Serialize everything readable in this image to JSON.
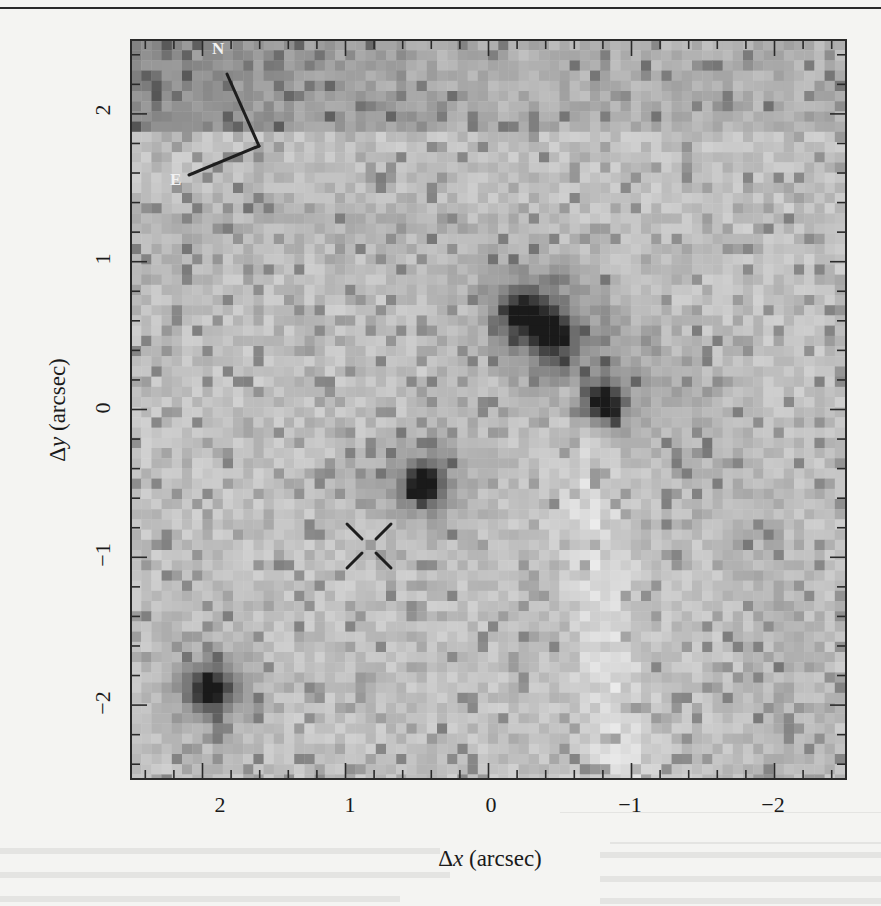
{
  "figure": {
    "type": "astronomical-image",
    "colormap": "grayscale-inverted",
    "frame_color": "#2a2a2a",
    "background_color": "#f4f4f2"
  },
  "chart_data": {
    "type": "heatmap",
    "title": "",
    "xlabel": "Δx (arcsec)",
    "xlabel_symbol": "Δ",
    "xlabel_var": "x",
    "xlabel_unit": " (arcsec)",
    "ylabel": "Δy (arcsec)",
    "ylabel_symbol": "Δ",
    "ylabel_var": "y",
    "ylabel_unit": " (arcsec)",
    "xlim": [
      2.5,
      -2.5
    ],
    "ylim": [
      -2.5,
      2.5
    ],
    "x_ticks": [
      2,
      1,
      0,
      -1,
      -2
    ],
    "x_tick_labels": [
      "2",
      "1",
      "0",
      "−1",
      "−2"
    ],
    "y_ticks": [
      2,
      1,
      0,
      -1,
      -2
    ],
    "y_tick_labels": [
      "2",
      "1",
      "0",
      "−1",
      "−2"
    ],
    "minor_tick_step": 0.2,
    "grid": false,
    "compass": {
      "north_label": "N",
      "east_label": "E"
    },
    "sources": [
      {
        "name": "source-a",
        "x": -0.25,
        "y": 0.65,
        "intensity": 0.85
      },
      {
        "name": "source-b",
        "x": -0.45,
        "y": 0.5,
        "intensity": 0.85
      },
      {
        "name": "source-c",
        "x": -0.8,
        "y": 0.05,
        "intensity": 0.95
      },
      {
        "name": "source-d",
        "x": 0.45,
        "y": -0.5,
        "intensity": 0.9
      },
      {
        "name": "source-e",
        "x": 1.95,
        "y": -1.9,
        "intensity": 0.95
      }
    ],
    "marker": {
      "type": "cross",
      "x": 0.83,
      "y": -1.0
    }
  }
}
